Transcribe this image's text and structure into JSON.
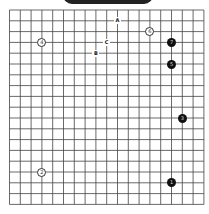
{
  "board": {
    "size": 19,
    "origin_x": 9.5,
    "origin_y": 10,
    "spacing": 10.8,
    "line_color": "#444444"
  },
  "stones": [
    {
      "move": "1",
      "color": "black",
      "col": 15,
      "row": 16
    },
    {
      "move": "2",
      "color": "white",
      "col": 3,
      "row": 15
    },
    {
      "move": "3",
      "color": "black",
      "col": 16,
      "row": 10
    },
    {
      "move": "4",
      "color": "white",
      "col": 3,
      "row": 3
    },
    {
      "move": "5",
      "color": "black",
      "col": 15,
      "row": 5
    },
    {
      "move": "6",
      "color": "white",
      "col": 13,
      "row": 2
    },
    {
      "move": "7",
      "color": "black",
      "col": 15,
      "row": 3
    }
  ],
  "marks": [
    {
      "label": "A",
      "col": 10,
      "row": 1
    },
    {
      "label": "C",
      "col": 9,
      "row": 3
    },
    {
      "label": "B",
      "col": 8,
      "row": 4
    }
  ]
}
